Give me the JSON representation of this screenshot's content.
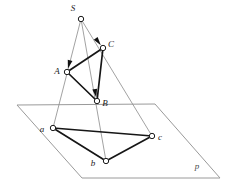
{
  "figure": {
    "width": 234,
    "height": 192,
    "background_color": "#ffffff"
  },
  "colors": {
    "solid_edge": "#161616",
    "projection_ray": "#8a8a8a",
    "plane_outline": "#9a9a9a",
    "vertex_fill": "#ffffff",
    "vertex_stroke": "#1a1a1a",
    "label_color": "#1a1a1a",
    "plane_label_color": "#4a4a4a"
  },
  "points": {
    "S": {
      "label": "S",
      "x": 81,
      "y": 19,
      "label_x": 73,
      "label_y": 9
    },
    "C": {
      "label": "C",
      "x": 103,
      "y": 48,
      "label_x": 111,
      "label_y": 45
    },
    "A": {
      "label": "A",
      "x": 67,
      "y": 72,
      "label_x": 57,
      "label_y": 72
    },
    "B": {
      "label": "B",
      "x": 97,
      "y": 101,
      "label_x": 105,
      "label_y": 104
    },
    "a": {
      "label": "a",
      "x": 53,
      "y": 128,
      "label_x": 42,
      "label_y": 130
    },
    "b": {
      "label": "b",
      "x": 106,
      "y": 161,
      "label_x": 93,
      "label_y": 164
    },
    "c": {
      "label": "c",
      "x": 152,
      "y": 136,
      "label_x": 160,
      "label_y": 138
    }
  },
  "plane": {
    "label": "p",
    "label_x": 197,
    "label_y": 167,
    "corners": [
      {
        "x": 17,
        "y": 105
      },
      {
        "x": 155,
        "y": 104
      },
      {
        "x": 220,
        "y": 178
      },
      {
        "x": 82,
        "y": 178
      }
    ]
  },
  "upper_triangle": {
    "name": "ABC",
    "vertices": [
      "A",
      "B",
      "C"
    ],
    "edges": [
      {
        "from": "A",
        "to": "B"
      },
      {
        "from": "B",
        "to": "C"
      },
      {
        "from": "C",
        "to": "A"
      }
    ]
  },
  "lower_triangle": {
    "name": "abc",
    "vertices": [
      "a",
      "b",
      "c"
    ],
    "edges": [
      {
        "from": "a",
        "to": "b"
      },
      {
        "from": "b",
        "to": "c"
      },
      {
        "from": "c",
        "to": "a"
      }
    ]
  },
  "projection_rays": [
    {
      "name": "ray-S-A-a",
      "from": "S",
      "through": "A",
      "to": "a",
      "arrow_at": "A"
    },
    {
      "name": "ray-S-B-b",
      "from": "S",
      "through": "B",
      "to": "b",
      "arrow_at": "B"
    },
    {
      "name": "ray-S-C-c",
      "from": "S",
      "through": "C",
      "to": "c",
      "arrow_at": "C"
    }
  ],
  "icons": {
    "vertex_marker": "small-circle-icon",
    "arrowhead": "arrowhead-icon"
  }
}
